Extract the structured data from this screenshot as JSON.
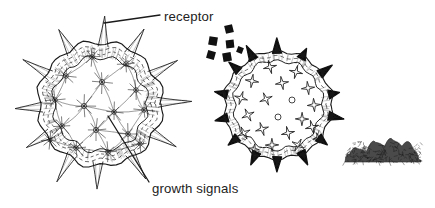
{
  "figure": {
    "background_color": "#ffffff",
    "ink_color": "#1a1a1a",
    "width": 435,
    "height": 208
  },
  "labels": {
    "receptor": {
      "text": "receptor",
      "x": 164,
      "y": 21,
      "leader_from_x": 104,
      "leader_from_y": 23,
      "leader_to_x": 160,
      "leader_to_y": 15
    },
    "growth_signals": {
      "text": "growth signals",
      "x": 152,
      "y": 193,
      "leader_from_x": 108,
      "leader_from_y": 116,
      "leader_to_x": 149,
      "leader_to_y": 182
    }
  },
  "left_cell": {
    "name": "signal-rich-cell",
    "center_x": 100,
    "center_y": 104,
    "outer_radius": 62,
    "membrane_rings": 4,
    "spike_count": 12,
    "spike_style": "long-thin-outlined",
    "spike_length": 26,
    "interior_marker_count": 16,
    "interior_marker_style": "networked-star-burst",
    "interior_markers": [
      {
        "x": -8,
        "y": -47,
        "r": 7
      },
      {
        "x": 26,
        "y": -40,
        "r": 7
      },
      {
        "x": -34,
        "y": -28,
        "r": 7
      },
      {
        "x": 2,
        "y": -22,
        "r": 8
      },
      {
        "x": 36,
        "y": -14,
        "r": 7
      },
      {
        "x": -45,
        "y": -4,
        "r": 7
      },
      {
        "x": -16,
        "y": 2,
        "r": 8
      },
      {
        "x": 14,
        "y": 8,
        "r": 7
      },
      {
        "x": 44,
        "y": 6,
        "r": 7
      },
      {
        "x": -38,
        "y": 22,
        "r": 7
      },
      {
        "x": -4,
        "y": 26,
        "r": 8
      },
      {
        "x": 28,
        "y": 30,
        "r": 7
      },
      {
        "x": -24,
        "y": 44,
        "r": 7
      },
      {
        "x": 8,
        "y": 48,
        "r": 7
      },
      {
        "x": 40,
        "y": 40,
        "r": 6
      },
      {
        "x": -50,
        "y": 36,
        "r": 6
      }
    ]
  },
  "right_cell": {
    "name": "receptor-rich-cell",
    "center_x": 278,
    "center_y": 105,
    "outer_radius": 54,
    "membrane_rings": 3,
    "spike_count": 14,
    "spike_style": "short-solid-black-triangular",
    "spike_length": 11,
    "interior_marker_count": 20,
    "interior_marker_style": "outlined-four-point-star",
    "interior_markers": [
      {
        "x": -8,
        "y": -38,
        "r": 5,
        "shape": "star"
      },
      {
        "x": 18,
        "y": -33,
        "r": 5,
        "shape": "star"
      },
      {
        "x": -26,
        "y": -24,
        "r": 5,
        "shape": "star"
      },
      {
        "x": 4,
        "y": -22,
        "r": 5,
        "shape": "star"
      },
      {
        "x": 30,
        "y": -17,
        "r": 5,
        "shape": "star"
      },
      {
        "x": -37,
        "y": -7,
        "r": 5,
        "shape": "star"
      },
      {
        "x": -12,
        "y": -6,
        "r": 5,
        "shape": "star"
      },
      {
        "x": 14,
        "y": -5,
        "r": 3,
        "shape": "circle"
      },
      {
        "x": 36,
        "y": 0,
        "r": 5,
        "shape": "star"
      },
      {
        "x": -30,
        "y": 10,
        "r": 5,
        "shape": "star"
      },
      {
        "x": 0,
        "y": 12,
        "r": 3,
        "shape": "circle"
      },
      {
        "x": 24,
        "y": 14,
        "r": 5,
        "shape": "star"
      },
      {
        "x": -16,
        "y": 24,
        "r": 5,
        "shape": "star"
      },
      {
        "x": 10,
        "y": 28,
        "r": 5,
        "shape": "star"
      },
      {
        "x": 34,
        "y": 22,
        "r": 5,
        "shape": "star"
      },
      {
        "x": -34,
        "y": 28,
        "r": 5,
        "shape": "star"
      },
      {
        "x": -6,
        "y": 40,
        "r": 5,
        "shape": "star"
      },
      {
        "x": 20,
        "y": 40,
        "r": 5,
        "shape": "star"
      },
      {
        "x": -24,
        "y": 44,
        "r": 4,
        "shape": "star"
      },
      {
        "x": 40,
        "y": 33,
        "r": 4,
        "shape": "star"
      }
    ]
  },
  "signal_particles": {
    "name": "free-growth-signal-squares",
    "count": 6,
    "fill": "#111111",
    "squares": [
      {
        "x": 229,
        "y": 29,
        "size": 8,
        "rot": -14
      },
      {
        "x": 213,
        "y": 41,
        "size": 8.5,
        "rot": 10
      },
      {
        "x": 230,
        "y": 44,
        "size": 8,
        "rot": -6
      },
      {
        "x": 211,
        "y": 55,
        "size": 8,
        "rot": 16
      },
      {
        "x": 227,
        "y": 57,
        "size": 8.5,
        "rot": -10
      },
      {
        "x": 240,
        "y": 50,
        "size": 6,
        "rot": 22
      }
    ]
  },
  "dark_mass": {
    "name": "dark-cell-mass",
    "x": 345,
    "y": 140,
    "width": 76,
    "height": 22,
    "fill": "#4a4a4a"
  }
}
